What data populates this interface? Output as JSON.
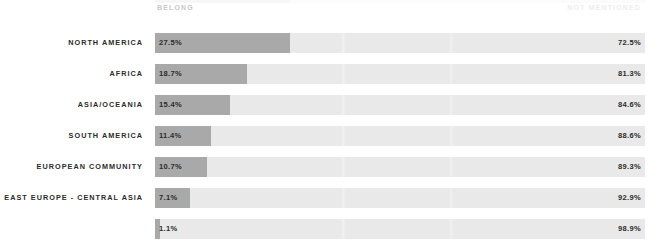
{
  "header": {
    "left_label": "BELONG",
    "right_label": "NOT MENTIONED"
  },
  "colors": {
    "background": "#ffffff",
    "bar_fill": "#a9a9a9",
    "bar_track": "#e9e9e9",
    "label_text": "#2b2b2b",
    "header_left_text": "#c7c7c7",
    "header_right_text": "#ededed"
  },
  "chart_data": {
    "type": "bar",
    "title": "",
    "subtitle": "",
    "xlabel": "",
    "ylabel": "",
    "xlim": [
      0,
      100
    ],
    "grid": false,
    "legend_position": "top",
    "orientation": "horizontal",
    "stacked": true,
    "categories": [
      "NORTH AMERICA",
      "AFRICA",
      "ASIA/OCEANIA",
      "SOUTH AMERICA",
      "EUROPEAN COMMUNITY",
      "EAST EUROPE - CENTRAL ASIA",
      ""
    ],
    "series": [
      {
        "name": "BELONG",
        "values": [
          27.5,
          18.7,
          15.4,
          11.4,
          10.7,
          7.1,
          1.1
        ],
        "labels": [
          "27.5%",
          "18.7%",
          "15.4%",
          "11.4%",
          "10.7%",
          "7.1%",
          "1.1%"
        ]
      },
      {
        "name": "NOT MENTIONED",
        "values": [
          72.5,
          81.3,
          84.6,
          88.6,
          89.3,
          92.9,
          98.9
        ],
        "labels": [
          "72.5%",
          "81.3%",
          "84.6%",
          "88.6%",
          "89.3%",
          "92.9%",
          "98.9%"
        ]
      }
    ]
  },
  "rows": [
    {
      "label": "NORTH AMERICA",
      "belong": 27.5,
      "belong_label": "27.5%",
      "not_mentioned_label": "72.5%"
    },
    {
      "label": "AFRICA",
      "belong": 18.7,
      "belong_label": "18.7%",
      "not_mentioned_label": "81.3%"
    },
    {
      "label": "ASIA/OCEANIA",
      "belong": 15.4,
      "belong_label": "15.4%",
      "not_mentioned_label": "84.6%"
    },
    {
      "label": "SOUTH AMERICA",
      "belong": 11.4,
      "belong_label": "11.4%",
      "not_mentioned_label": "88.6%"
    },
    {
      "label": "EUROPEAN COMMUNITY",
      "belong": 10.7,
      "belong_label": "10.7%",
      "not_mentioned_label": "89.3%"
    },
    {
      "label": "EAST EUROPE - CENTRAL ASIA",
      "belong": 7.1,
      "belong_label": "7.1%",
      "not_mentioned_label": "92.9%"
    },
    {
      "label": "",
      "belong": 1.1,
      "belong_label": "1.1%",
      "not_mentioned_label": "98.9%"
    }
  ]
}
